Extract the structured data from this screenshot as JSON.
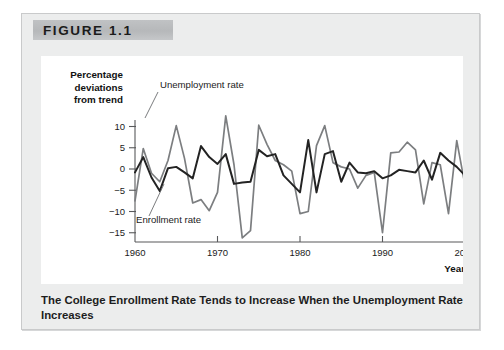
{
  "figure": {
    "banner_label": "FIGURE 1.1",
    "caption": "The College Enrollment Rate Tends to Increase When the Unemployment Rate Increases"
  },
  "chart_data": {
    "type": "line",
    "title": "",
    "xlabel": "Year",
    "ylabel": "Percentage deviations from trend",
    "xlim": [
      1960,
      2000
    ],
    "ylim": [
      -17,
      13
    ],
    "xticks": [
      1960,
      1970,
      1980,
      1990,
      2000
    ],
    "yticks": [
      10,
      5,
      0,
      -5,
      -10,
      -15
    ],
    "grid": false,
    "legend_position": "inline-annotation",
    "annotations": [
      {
        "text": "Unemployment rate",
        "series": "Unemployment rate"
      },
      {
        "text": "Enrollment rate",
        "series": "Enrollment rate"
      }
    ],
    "colors": {
      "unemployment": "#7c7e80",
      "enrollment": "#232323",
      "axis": "#58595b",
      "panel": "#eceded",
      "banner": "#b8babc",
      "plot_background": "#ffffff"
    },
    "x": [
      1960,
      1961,
      1962,
      1963,
      1964,
      1965,
      1966,
      1967,
      1968,
      1969,
      1970,
      1971,
      1972,
      1973,
      1974,
      1975,
      1976,
      1977,
      1978,
      1979,
      1980,
      1981,
      1982,
      1983,
      1984,
      1985,
      1986,
      1987,
      1988,
      1989,
      1990,
      1991,
      1992,
      1993,
      1994,
      1995,
      1996,
      1997,
      1998,
      1999,
      2000
    ],
    "series": [
      {
        "name": "Unemployment rate",
        "color": "#7c7e80",
        "values": [
          -7.5,
          4.8,
          -1.0,
          -3.0,
          2.0,
          10.2,
          2.5,
          -8.0,
          -7.2,
          -9.8,
          -5.5,
          12.5,
          1.0,
          -16.2,
          -14.5,
          10.3,
          5.8,
          2.0,
          1.0,
          -0.5,
          -10.5,
          -10.0,
          5.5,
          10.2,
          1.5,
          0.5,
          0.0,
          -4.5,
          -1.5,
          -0.8,
          -15.0,
          3.8,
          4.0,
          6.3,
          4.5,
          -8.2,
          1.5,
          1.0,
          -10.5,
          6.7,
          -3.8
        ]
      },
      {
        "name": "Enrollment rate",
        "color": "#232323",
        "values": [
          -0.8,
          2.8,
          -2.0,
          -5.2,
          0.2,
          0.5,
          -0.8,
          -2.2,
          5.4,
          2.8,
          1.2,
          3.5,
          -3.5,
          -3.2,
          -3.0,
          4.5,
          3.0,
          3.5,
          -1.5,
          -3.5,
          -5.5,
          6.8,
          -5.5,
          3.5,
          4.2,
          -3.0,
          1.5,
          -0.8,
          -1.0,
          -0.5,
          -2.2,
          -1.5,
          -0.2,
          -0.5,
          -0.8,
          2.0,
          -2.5,
          3.8,
          2.0,
          0.5,
          -1.5
        ]
      }
    ]
  }
}
